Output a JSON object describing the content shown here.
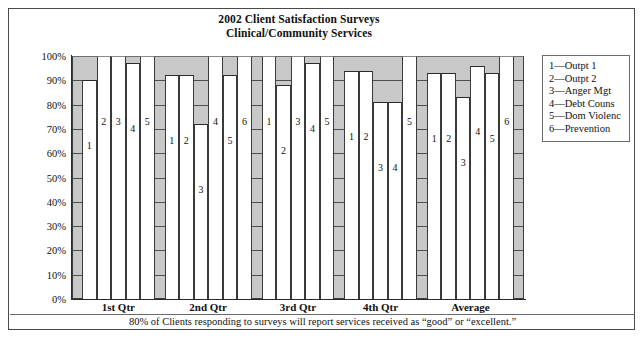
{
  "chart_data": {
    "type": "bar",
    "title": "2002 Client Satisfaction Surveys",
    "subtitle": "Clinical/Community Services",
    "xlabel": "",
    "ylabel": "",
    "ylim": [
      0,
      100
    ],
    "ytick_labels": [
      "100%",
      "90%",
      "80%",
      "70%",
      "60%",
      "50%",
      "40%",
      "30%",
      "20%",
      "10%",
      "0%"
    ],
    "ytick_values": [
      100,
      90,
      80,
      70,
      60,
      50,
      40,
      30,
      20,
      10,
      0
    ],
    "grid": true,
    "legend_position": "right",
    "categories": [
      "1st Qtr",
      "2nd Qtr",
      "3rd Qtr",
      "4th Qtr",
      "Average"
    ],
    "series": [
      {
        "name": "1",
        "legend": "1—Outpt 1",
        "values": [
          90,
          92,
          100,
          94,
          93
        ]
      },
      {
        "name": "2",
        "legend": "2—Outpt 2",
        "values": [
          100,
          92,
          88,
          94,
          93
        ]
      },
      {
        "name": "3",
        "legend": "3—Anger Mgt",
        "values": [
          100,
          72,
          100,
          81,
          83
        ]
      },
      {
        "name": "4",
        "legend": "4—Debt Couns",
        "values": [
          97,
          100,
          97,
          81,
          96
        ]
      },
      {
        "name": "5",
        "legend": "5—Dom Violenc",
        "values": [
          100,
          92,
          100,
          100,
          93
        ]
      },
      {
        "name": "6",
        "legend": "6—Prevention",
        "values": [
          null,
          100,
          null,
          null,
          100
        ]
      }
    ],
    "groups": [
      {
        "label": "1st Qtr",
        "bars": [
          {
            "label": "1",
            "value": 90
          },
          {
            "label": "2",
            "value": 100
          },
          {
            "label": "3",
            "value": 100
          },
          {
            "label": "4",
            "value": 97
          },
          {
            "label": "5",
            "value": 100
          }
        ]
      },
      {
        "label": "2nd Qtr",
        "bars": [
          {
            "label": "1",
            "value": 92
          },
          {
            "label": "2",
            "value": 92
          },
          {
            "label": "3",
            "value": 72
          },
          {
            "label": "4",
            "value": 100
          },
          {
            "label": "5",
            "value": 92
          },
          {
            "label": "6",
            "value": 100
          }
        ]
      },
      {
        "label": "3rd Qtr",
        "bars": [
          {
            "label": "1",
            "value": 100
          },
          {
            "label": "2",
            "value": 88
          },
          {
            "label": "3",
            "value": 100
          },
          {
            "label": "4",
            "value": 97
          },
          {
            "label": "5",
            "value": 100
          }
        ]
      },
      {
        "label": "4th Qtr",
        "bars": [
          {
            "label": "1",
            "value": 94
          },
          {
            "label": "2",
            "value": 94
          },
          {
            "label": "3",
            "value": 81
          },
          {
            "label": "4",
            "value": 81
          },
          {
            "label": "5",
            "value": 100
          }
        ]
      },
      {
        "label": "Average",
        "bars": [
          {
            "label": "1",
            "value": 93
          },
          {
            "label": "2",
            "value": 93
          },
          {
            "label": "3",
            "value": 83
          },
          {
            "label": "4",
            "value": 96
          },
          {
            "label": "5",
            "value": 93
          },
          {
            "label": "6",
            "value": 100
          }
        ]
      }
    ],
    "annotations": [
      "80% of Clients responding to surveys will report services received as “good” or “excellent.”"
    ],
    "colors": {
      "plot_background": "#c8c8c8",
      "bar_fill": "#ffffff",
      "bar_outline": "#3a3a3a",
      "gridline": "#4f4f4f",
      "frame": "#4a4a4a",
      "text": "#111111"
    }
  },
  "footer": {
    "note": "80% of Clients responding to surveys will report services received as “good” or “excellent.”"
  }
}
